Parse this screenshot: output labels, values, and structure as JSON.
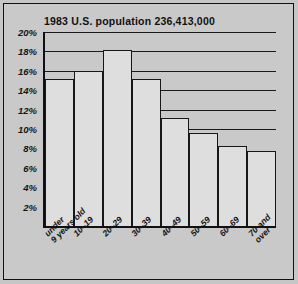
{
  "chart_data": {
    "type": "bar",
    "title": "1983  U.S. population  236,413,000",
    "xlabel": "",
    "ylabel": "",
    "ylim": [
      0,
      20
    ],
    "grid": true,
    "legend": "none",
    "y_ticks": [
      "20%",
      "18%",
      "16%",
      "14%",
      "12%",
      "10%",
      "8%",
      "6%",
      "4%",
      "2%"
    ],
    "y_tick_values": [
      20,
      18,
      16,
      14,
      12,
      10,
      8,
      6,
      4,
      2
    ],
    "categories": [
      "under\n9 years old",
      "10–19",
      "20–29",
      "30–39",
      "40–49",
      "50–59",
      "60–69",
      "70 and\nover"
    ],
    "values": [
      15.2,
      16.0,
      18.1,
      15.2,
      11.1,
      9.6,
      8.3,
      7.7
    ],
    "colors": {
      "background": "#c9c9c9",
      "bar_fill": "#dedede",
      "bar_stroke": "#171717",
      "axis": "#111111",
      "gridline": "#1a1a1a",
      "text": "#121212"
    }
  }
}
